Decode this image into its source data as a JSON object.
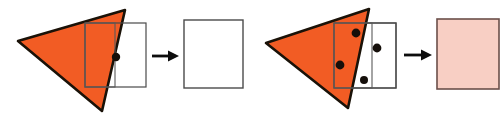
{
  "figure": {
    "background_color": "#ffffff",
    "width": 504,
    "height": 119
  },
  "colors": {
    "triangle_fill": "#F25C24",
    "triangle_stroke": "#1a1208",
    "square_stroke": "#4a4a4a",
    "inner_rect_stroke": "#5a5a5a",
    "dot_fill": "#150f0a",
    "arrow_color": "#0d0d0d",
    "output_white_fill": "#ffffff",
    "output_white_stroke": "#4a4a4a",
    "output_pink_fill": "#F8CFC4",
    "output_pink_stroke": "#6b4f4a"
  },
  "panels": [
    {
      "id": "panel-left",
      "name": "panel-one",
      "label": "",
      "triangle": {
        "name": "orange-triangle",
        "points": "18,41 125,10 102,111",
        "fill": "#F25C24",
        "stroke": "#1a1208",
        "stroke_width": 2.6
      },
      "inner_rect": {
        "name": "inner-rectangle",
        "x": 85,
        "y": 23,
        "width": 30,
        "height": 64,
        "fill": "none",
        "stroke": "#5a5a5a",
        "stroke_width": 1.1
      },
      "square": {
        "name": "input-square",
        "x": 85,
        "y": 23,
        "width": 61,
        "height": 64,
        "fill": "none",
        "stroke": "#4a4a4a",
        "stroke_width": 1.2
      },
      "dots": [
        {
          "name": "sample-dot",
          "cx": 116,
          "cy": 57,
          "r": 4.2
        }
      ],
      "dot_count": 1,
      "arrow": {
        "name": "transform-arrow",
        "x1": 152,
        "y1": 56,
        "x2": 179,
        "y2": 56,
        "head_width": 11,
        "head_height": 11,
        "shaft_width": 2.8
      },
      "output": {
        "name": "output-square-empty",
        "x": 184,
        "y": 20,
        "width": 59,
        "height": 68,
        "fill": "#ffffff",
        "stroke": "#4a4a4a",
        "stroke_width": 1.4,
        "state": "empty"
      }
    },
    {
      "id": "panel-right",
      "name": "panel-two",
      "label": "",
      "triangle": {
        "name": "orange-triangle",
        "points": "14,43 117,9 96,108",
        "fill": "#F25C24",
        "stroke": "#1a1208",
        "stroke_width": 2.6
      },
      "inner_rect": {
        "name": "inner-rectangle",
        "x": 82,
        "y": 23,
        "width": 38,
        "height": 65,
        "fill": "none",
        "stroke": "#5a5a5a",
        "stroke_width": 1.1
      },
      "square": {
        "name": "input-square",
        "x": 82,
        "y": 23,
        "width": 62,
        "height": 65,
        "fill": "none",
        "stroke": "#4a4a4a",
        "stroke_width": 1.2
      },
      "dots": [
        {
          "name": "sample-dot",
          "cx": 104,
          "cy": 33,
          "r": 4.4
        },
        {
          "name": "sample-dot",
          "cx": 88,
          "cy": 65,
          "r": 4.4
        },
        {
          "name": "sample-dot",
          "cx": 125,
          "cy": 48,
          "r": 4.4
        },
        {
          "name": "sample-dot",
          "cx": 112,
          "cy": 80,
          "r": 4.0
        }
      ],
      "dot_count": 4,
      "arrow": {
        "name": "transform-arrow",
        "x1": 152,
        "y1": 55,
        "x2": 180,
        "y2": 55,
        "head_width": 11,
        "head_height": 11,
        "shaft_width": 2.8
      },
      "output": {
        "name": "output-square-filled",
        "x": 185,
        "y": 19,
        "width": 62,
        "height": 70,
        "fill": "#F8CFC4",
        "stroke": "#6b4f4a",
        "stroke_width": 1.6,
        "state": "filled"
      }
    }
  ]
}
